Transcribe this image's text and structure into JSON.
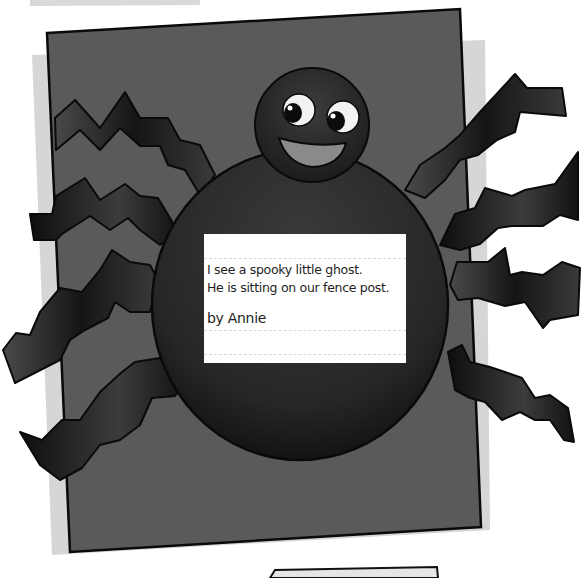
{
  "artwork": {
    "subject": "Paper spider craft with accordion-folded legs",
    "colors": {
      "background": "#ffffff",
      "shadow_paper": "#d6d6d6",
      "backing_paper": "#5a5a5a",
      "spider_body": "#2e2e2e",
      "legs": "#1c1c1c",
      "outline": "#0a0a0a",
      "card": "#ffffff",
      "eye_white": "#f2f2f2",
      "mouth": "#8a8a8a"
    },
    "legs_left": 4,
    "legs_right": 4
  },
  "poem": {
    "lines": [
      "I see a spooky little ghost.",
      "He is sitting on our fence post."
    ],
    "author": "by Annie"
  }
}
